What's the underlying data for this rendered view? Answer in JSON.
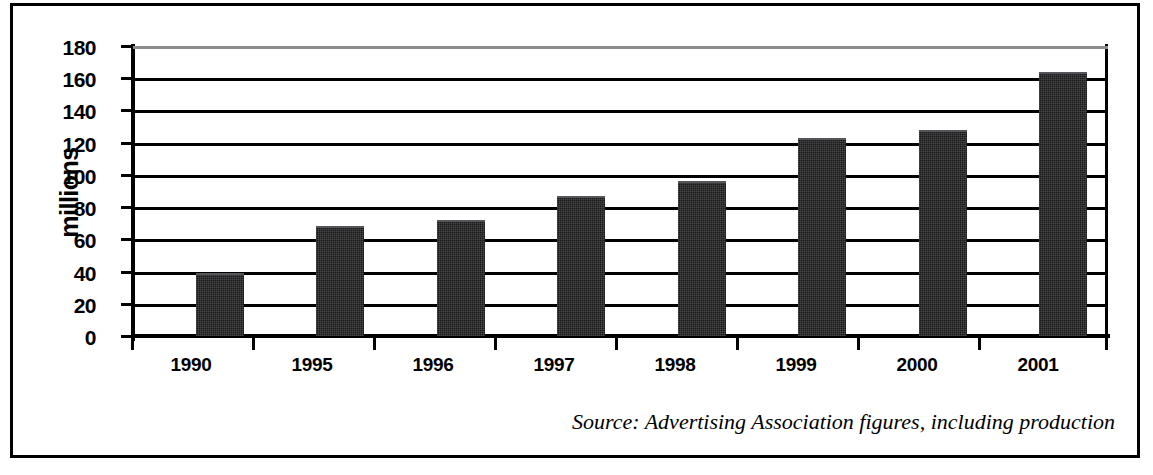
{
  "chart_data": {
    "type": "bar",
    "title": "",
    "xlabel": "",
    "ylabel": "millions",
    "ylim": [
      0,
      180
    ],
    "ytick_step": 20,
    "yticks": [
      180,
      160,
      140,
      120,
      100,
      80,
      60,
      40,
      20,
      0
    ],
    "grid": true,
    "legend": "none",
    "categories": [
      "1990",
      "1995",
      "1996",
      "1997",
      "1998",
      "1999",
      "2000",
      "2001"
    ],
    "values": [
      39,
      68,
      72,
      87,
      96,
      123,
      128,
      164
    ],
    "series": [
      {
        "name": "UK advertising expenditure",
        "values": [
          39,
          68,
          72,
          87,
          96,
          123,
          128,
          164
        ],
        "color": "#1a1a1a"
      }
    ],
    "annotations": [
      "Source: Advertising Association figures, including production"
    ]
  },
  "axis": {
    "y_title": "millions",
    "y_ticks": [
      "180",
      "160",
      "140",
      "120",
      "100",
      "80",
      "60",
      "40",
      "20",
      "0"
    ],
    "x_ticks": [
      "1990",
      "1995",
      "1996",
      "1997",
      "1998",
      "1999",
      "2000",
      "2001"
    ]
  },
  "footer": {
    "source_text": "Source: Advertising Association figures, including production"
  },
  "style": {
    "bar_color": "#1a1a1a",
    "axis_color": "#000000",
    "grid_color": "#000000",
    "top_grid_color": "#8d8d8d",
    "background": "#ffffff",
    "border_color": "#000000"
  }
}
